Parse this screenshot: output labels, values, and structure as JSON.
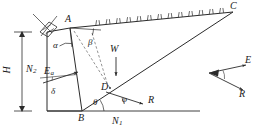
{
  "figure": {
    "name": "coulomb-active-earth-pressure-retaining-wall",
    "caption": "",
    "stroke_color": "#2b2b2b",
    "dash_color": "#555555",
    "background": "#ffffff"
  },
  "points": {
    "A": "A",
    "B": "B",
    "C": "C",
    "D": "D"
  },
  "angles": {
    "alpha": "α",
    "beta": "β",
    "delta": "δ",
    "theta": "θ",
    "phi": "φ"
  },
  "forces": {
    "W": "W",
    "R": "R",
    "E_main": "E",
    "E_main_sub": "a",
    "N1": "N",
    "N1_sub": "1",
    "N2": "N",
    "N2_sub": "2"
  },
  "dimensions": {
    "H": "H"
  },
  "inset": {
    "name": "force-triangle",
    "E": "E",
    "R": "R"
  },
  "geometry": {
    "A": [
      70,
      28
    ],
    "B": [
      82,
      111
    ],
    "C": [
      233,
      12
    ],
    "D": [
      110,
      88
    ],
    "wall_top_left": [
      47,
      32
    ],
    "wall_bot_left": [
      47,
      111
    ],
    "ground_line_y": 111,
    "ground_line_x1": 47,
    "ground_line_x2": 200,
    "dim_line_x": 22,
    "dim_top_y": 32,
    "dim_bot_y": 111
  },
  "hatch": {
    "name": "ground-surcharge-hatch",
    "count": 13,
    "start_t": 0.17,
    "end_t": 0.93
  }
}
